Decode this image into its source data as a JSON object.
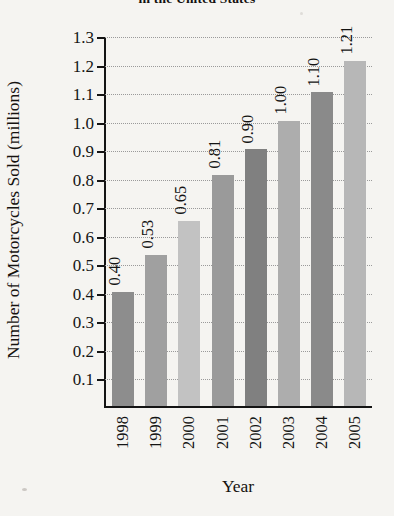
{
  "chart_data": {
    "type": "bar",
    "title": "in the United States",
    "xlabel": "Year",
    "ylabel": "Number of Motorcycles Sold (millions)",
    "categories": [
      "1998",
      "1999",
      "2000",
      "2001",
      "2002",
      "2003",
      "2004",
      "2005"
    ],
    "values": [
      0.4,
      0.53,
      0.65,
      0.81,
      0.9,
      1.0,
      1.1,
      1.21
    ],
    "value_labels": [
      "0.40",
      "0.53",
      "0.65",
      "0.81",
      "0.90",
      "1.00",
      "1.10",
      "1.21"
    ],
    "bar_colors": [
      "#8d8d8d",
      "#a0a0a0",
      "#c2c2c2",
      "#9a9a9a",
      "#808080",
      "#adadad",
      "#8a8a8a",
      "#b7b7b7"
    ],
    "ylim": [
      0,
      1.3
    ],
    "ytick_labels": [
      "1.3",
      "1.2",
      "1.1",
      "1.0",
      "0.9",
      "0.8",
      "0.7",
      "0.6",
      "0.5",
      "0.4",
      "0.3",
      "0.2",
      "0.1"
    ],
    "ytick_values": [
      1.3,
      1.2,
      1.1,
      1.0,
      0.9,
      0.8,
      0.7,
      0.6,
      0.5,
      0.4,
      0.3,
      0.2,
      0.1
    ],
    "grid": true,
    "grid_style": "dotted",
    "legend": "none",
    "axis_color": "#141414",
    "background_color": "#f5f4f1"
  }
}
